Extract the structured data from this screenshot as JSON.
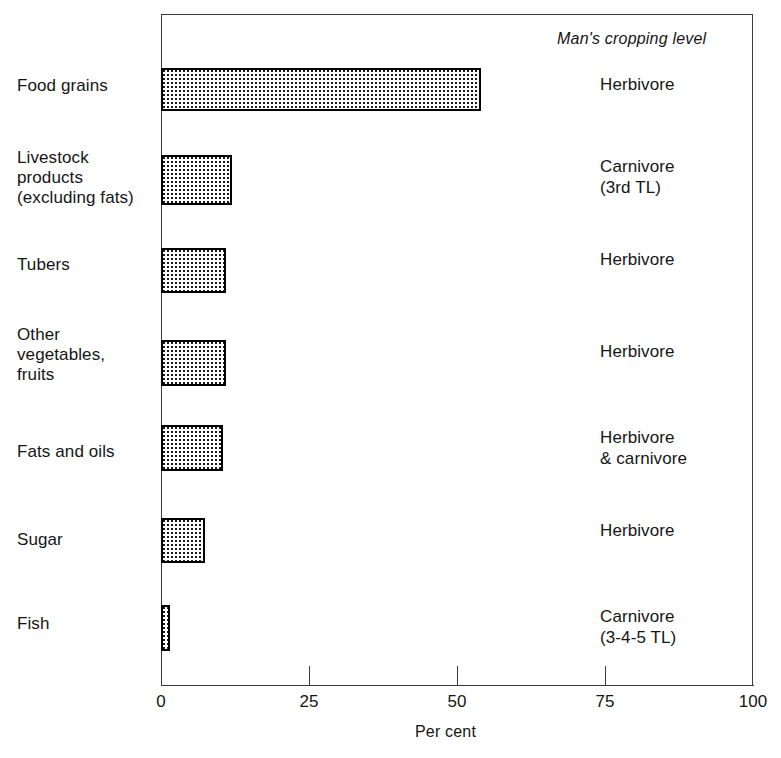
{
  "chart_data": {
    "type": "bar",
    "orientation": "horizontal",
    "title": "",
    "xlabel": "Per cent",
    "ylabel": "",
    "xlim": [
      0,
      100
    ],
    "xticks": [
      0,
      25,
      50,
      75,
      100
    ],
    "xtick_labels": [
      "0",
      "25",
      "50",
      "75",
      "100"
    ],
    "grid": false,
    "legend": null,
    "categories": [
      "Food grains",
      "Livestock products (excluding fats)",
      "Tubers",
      "Other vegetables, fruits",
      "Fats and oils",
      "Sugar",
      "Fish"
    ],
    "values": [
      54,
      12,
      11,
      11,
      10.5,
      7.5,
      1.5
    ],
    "annotation_column_title": "Man's cropping level",
    "annotations": [
      "Herbivore",
      "Carnivore (3rd TL)",
      "Herbivore",
      "Herbivore",
      "Herbivore & carnivore",
      "Herbivore",
      "Carnivore (3-4-5 TL)"
    ]
  },
  "axis": {
    "x_title": "Per cent",
    "ticks": [
      {
        "label": "0",
        "value": 0
      },
      {
        "label": "25",
        "value": 25
      },
      {
        "label": "50",
        "value": 50
      },
      {
        "label": "75",
        "value": 75
      },
      {
        "label": "100",
        "value": 100
      }
    ]
  },
  "annotation_header": "Man's cropping level",
  "rows": [
    {
      "category_lines": [
        "Food grains"
      ],
      "category": "Food grains",
      "value": 54,
      "annotation_lines": [
        "Herbivore"
      ],
      "annotation": "Herbivore"
    },
    {
      "category_lines": [
        "Livestock",
        "products",
        "(excluding fats)"
      ],
      "category": "Livestock products (excluding fats)",
      "value": 12,
      "annotation_lines": [
        "Carnivore",
        "(3rd TL)"
      ],
      "annotation": "Carnivore (3rd TL)"
    },
    {
      "category_lines": [
        "Tubers"
      ],
      "category": "Tubers",
      "value": 11,
      "annotation_lines": [
        "Herbivore"
      ],
      "annotation": "Herbivore"
    },
    {
      "category_lines": [
        "Other",
        "vegetables,",
        "fruits"
      ],
      "category": "Other vegetables, fruits",
      "value": 11,
      "annotation_lines": [
        "Herbivore"
      ],
      "annotation": "Herbivore"
    },
    {
      "category_lines": [
        "Fats and oils"
      ],
      "category": "Fats and oils",
      "value": 10.5,
      "annotation_lines": [
        "Herbivore",
        "& carnivore"
      ],
      "annotation": "Herbivore & carnivore"
    },
    {
      "category_lines": [
        "Sugar"
      ],
      "category": "Sugar",
      "value": 7.5,
      "annotation_lines": [
        "Herbivore"
      ],
      "annotation": "Herbivore"
    },
    {
      "category_lines": [
        "Fish"
      ],
      "category": "Fish",
      "value": 1.5,
      "annotation_lines": [
        "Carnivore",
        "(3-4-5 TL)"
      ],
      "annotation": "Carnivore (3-4-5 TL)"
    }
  ],
  "colors": {
    "bar_border": "#000000",
    "bar_fill_dot": "#1a1a1a",
    "bar_background": "#ffffff",
    "axis": "#3a3a3a",
    "text": "#151515",
    "page_background": "#ffffff"
  },
  "geometry": {
    "plot_left": 161,
    "plot_right": 753,
    "plot_top": 14,
    "baseline_y": 685,
    "bar_tops": [
      68,
      155,
      248,
      340,
      425,
      518,
      605
    ],
    "bar_heights": [
      43,
      50,
      45,
      46,
      46,
      45,
      46
    ],
    "label_tops": [
      76,
      148,
      255,
      325,
      442,
      530,
      614
    ],
    "annot_tops": [
      74,
      156,
      249,
      341,
      427,
      520,
      606
    ]
  }
}
